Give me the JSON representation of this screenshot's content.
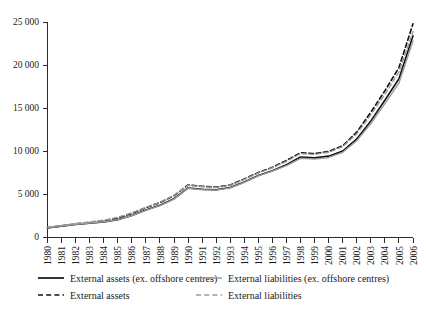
{
  "chart_data": {
    "type": "line",
    "title": "",
    "subtitle": "",
    "xlabel": "",
    "ylabel": "",
    "grid": false,
    "legend_position": "bottom",
    "xlim": [
      1980,
      2006
    ],
    "ylim": [
      0,
      25000
    ],
    "y_ticks": [
      0,
      5000,
      10000,
      15000,
      20000,
      25000
    ],
    "y_tick_labels": [
      "0",
      "5 000",
      "10 000",
      "15 000",
      "20 000",
      "25 000"
    ],
    "categories": [
      "1980",
      "1981",
      "1982",
      "1983",
      "1984",
      "1985",
      "1986",
      "1987",
      "1988",
      "1989",
      "1990",
      "1991",
      "1992",
      "1993",
      "1994",
      "1995",
      "1996",
      "1997",
      "1998",
      "1999",
      "2000",
      "2001",
      "2002",
      "2003",
      "2004",
      "2005",
      "2006"
    ],
    "series": [
      {
        "name": "External assets (ex. offshore centres)",
        "style": "solid",
        "color": "#111111",
        "width": 1.6,
        "values": [
          1050,
          1250,
          1450,
          1600,
          1750,
          2000,
          2500,
          3150,
          3700,
          4450,
          5700,
          5550,
          5500,
          5750,
          6400,
          7150,
          7700,
          8400,
          9300,
          9200,
          9400,
          10000,
          11400,
          13500,
          15900,
          18400,
          23400
        ]
      },
      {
        "name": "External assets",
        "style": "dashed",
        "color": "#111111",
        "width": 1.6,
        "values": [
          1100,
          1300,
          1520,
          1700,
          1900,
          2200,
          2750,
          3400,
          4000,
          4800,
          6050,
          5900,
          5800,
          6050,
          6750,
          7500,
          8100,
          8900,
          9800,
          9700,
          9950,
          10600,
          12200,
          14500,
          17000,
          19700,
          24800
        ]
      },
      {
        "name": "External liabilities (ex. offshore centres)",
        "style": "solid",
        "color": "#9a9a9a",
        "width": 1.4,
        "values": [
          1080,
          1280,
          1480,
          1620,
          1780,
          2020,
          2480,
          3100,
          3650,
          4400,
          5650,
          5500,
          5450,
          5700,
          6350,
          7100,
          7650,
          8300,
          9150,
          9050,
          9250,
          9850,
          11200,
          13200,
          15500,
          17900,
          22800
        ]
      },
      {
        "name": "External liabilities",
        "style": "dashed",
        "color": "#9a9a9a",
        "width": 1.4,
        "values": [
          1120,
          1330,
          1560,
          1750,
          1960,
          2280,
          2820,
          3450,
          4050,
          4850,
          6000,
          5850,
          5760,
          6000,
          6700,
          7450,
          8050,
          8800,
          9700,
          9600,
          9850,
          10500,
          12000,
          14200,
          16600,
          19200,
          23900
        ]
      }
    ],
    "legend": [
      {
        "label": "External assets (ex. offshore centres)",
        "style": "solid",
        "color": "#111111",
        "column": 0,
        "row": 0
      },
      {
        "label": "External liabilities (ex. offshore centres)",
        "style": "solid",
        "color": "#9a9a9a",
        "column": 1,
        "row": 0
      },
      {
        "label": "External assets",
        "style": "dashed",
        "color": "#111111",
        "column": 0,
        "row": 1
      },
      {
        "label": "External liabilities",
        "style": "dashed",
        "color": "#9a9a9a",
        "column": 1,
        "row": 1
      }
    ]
  }
}
